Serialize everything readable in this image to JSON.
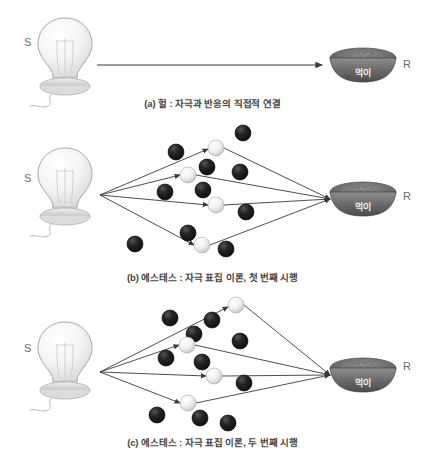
{
  "figure": {
    "title_alt": "S-R diagrams",
    "background": "#ffffff",
    "line_color": "#3a3a3a",
    "dot_dark_color": "#1c1c1c",
    "dot_light_color": "#f2f2f2",
    "label_color": "#6b6b6b",
    "caption_color": "#444444"
  },
  "labels": {
    "stimulus": "S",
    "response": "R",
    "bowl_text": "먹이"
  },
  "panels": [
    {
      "id": "a",
      "caption": "(a) 헐 : 자극과 반응의 직접적 연결",
      "stimulus_label": "S",
      "response_label": "R",
      "bowl_label": "먹이",
      "dots": [],
      "arrows": [
        {
          "x1": 97,
          "y1": 65,
          "x2": 322,
          "y2": 65
        }
      ]
    },
    {
      "id": "b",
      "caption": "(b) 에스테스 : 자극 표집 이론, 첫 번째 시행",
      "stimulus_label": "S",
      "response_label": "R",
      "bowl_label": "먹이",
      "dark_dots": [
        {
          "x": 176,
          "y": 152,
          "r": 8
        },
        {
          "x": 207,
          "y": 167,
          "r": 8
        },
        {
          "x": 243,
          "y": 133,
          "r": 8
        },
        {
          "x": 240,
          "y": 172,
          "r": 8
        },
        {
          "x": 165,
          "y": 192,
          "r": 8
        },
        {
          "x": 203,
          "y": 190,
          "r": 8
        },
        {
          "x": 246,
          "y": 212,
          "r": 8
        },
        {
          "x": 135,
          "y": 244,
          "r": 8
        },
        {
          "x": 188,
          "y": 233,
          "r": 8
        },
        {
          "x": 226,
          "y": 249,
          "r": 8
        }
      ],
      "light_dots": [
        {
          "x": 216,
          "y": 148,
          "r": 8
        },
        {
          "x": 188,
          "y": 175,
          "r": 8
        },
        {
          "x": 216,
          "y": 205,
          "r": 8
        },
        {
          "x": 202,
          "y": 245,
          "r": 8
        }
      ],
      "arrows_out": [
        {
          "x1": 100,
          "y1": 195,
          "x2": 208,
          "y2": 149
        },
        {
          "x1": 100,
          "y1": 195,
          "x2": 180,
          "y2": 175
        },
        {
          "x1": 100,
          "y1": 195,
          "x2": 208,
          "y2": 205
        },
        {
          "x1": 100,
          "y1": 195,
          "x2": 194,
          "y2": 245
        }
      ],
      "arrows_in": [
        {
          "x1": 224,
          "y1": 148,
          "x2": 330,
          "y2": 199
        },
        {
          "x1": 196,
          "y1": 175,
          "x2": 330,
          "y2": 199
        },
        {
          "x1": 224,
          "y1": 205,
          "x2": 330,
          "y2": 199
        },
        {
          "x1": 210,
          "y1": 245,
          "x2": 330,
          "y2": 199
        }
      ]
    },
    {
      "id": "c",
      "caption": "(c) 에스테스 : 자극 표집 이론, 두 번째 시행",
      "stimulus_label": "S",
      "response_label": "R",
      "bowl_label": "먹이",
      "dark_dots": [
        {
          "x": 170,
          "y": 318,
          "r": 8
        },
        {
          "x": 212,
          "y": 320,
          "r": 8
        },
        {
          "x": 194,
          "y": 334,
          "r": 8
        },
        {
          "x": 240,
          "y": 341,
          "r": 8
        },
        {
          "x": 166,
          "y": 358,
          "r": 8
        },
        {
          "x": 202,
          "y": 362,
          "r": 8
        },
        {
          "x": 244,
          "y": 383,
          "r": 8
        },
        {
          "x": 157,
          "y": 415,
          "r": 8
        },
        {
          "x": 200,
          "y": 418,
          "r": 8
        },
        {
          "x": 228,
          "y": 423,
          "r": 8
        }
      ],
      "light_dots": [
        {
          "x": 236,
          "y": 305,
          "r": 8
        },
        {
          "x": 187,
          "y": 345,
          "r": 8
        },
        {
          "x": 214,
          "y": 376,
          "r": 8
        },
        {
          "x": 188,
          "y": 403,
          "r": 8
        }
      ],
      "arrows_out": [
        {
          "x1": 100,
          "y1": 372,
          "x2": 228,
          "y2": 307
        },
        {
          "x1": 100,
          "y1": 372,
          "x2": 179,
          "y2": 345
        },
        {
          "x1": 100,
          "y1": 372,
          "x2": 206,
          "y2": 376
        },
        {
          "x1": 100,
          "y1": 372,
          "x2": 180,
          "y2": 403
        }
      ],
      "arrows_in": [
        {
          "x1": 244,
          "y1": 305,
          "x2": 330,
          "y2": 375
        },
        {
          "x1": 195,
          "y1": 345,
          "x2": 330,
          "y2": 375
        },
        {
          "x1": 222,
          "y1": 376,
          "x2": 330,
          "y2": 375
        },
        {
          "x1": 196,
          "y1": 403,
          "x2": 330,
          "y2": 375
        }
      ]
    }
  ]
}
